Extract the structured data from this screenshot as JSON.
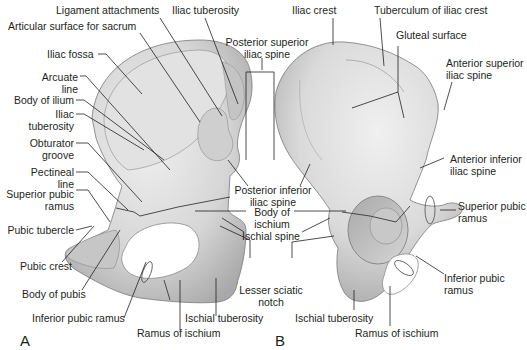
{
  "figure": {
    "panels": [
      {
        "id": "A",
        "label": "A",
        "view": "medial"
      },
      {
        "id": "B",
        "label": "B",
        "view": "lateral"
      }
    ],
    "colors": {
      "background": "#ffffff",
      "bone_light": "#e6e6e6",
      "bone_mid": "#c9c9c9",
      "bone_dark": "#9d9d9d",
      "leader_line": "#231f20",
      "text": "#231f20"
    },
    "labels_A": {
      "ligament_attachments": "Ligament attachments",
      "iliac_tuberosity_top": "Iliac tuberosity",
      "articular_surface": "Articular surface for sacrum",
      "iliac_fossa": "Iliac fossa",
      "arcuate_line_1": "Arcuate",
      "arcuate_line_2": "line",
      "body_of_ilium": "Body of ilium",
      "iliac_tuberosity_1": "Iliac",
      "iliac_tuberosity_2": "tuberosity",
      "obturator_groove_1": "Obturator",
      "obturator_groove_2": "groove",
      "pectineal_line_1": "Pectineal",
      "pectineal_line_2": "line",
      "superior_pubic_ramus_1": "Superior pubic",
      "superior_pubic_ramus_2": "ramus",
      "pubic_tubercle": "Pubic tubercle",
      "pubic_crest": "Pubic crest",
      "body_of_pubis": "Body of pubis",
      "inferior_pubic_ramus": "Inferior pubic ramus",
      "ramus_of_ischium": "Ramus of ischium",
      "ischial_tuberosity": "Ischial tuberosity"
    },
    "labels_shared": {
      "posterior_superior_1": "Posterior superior",
      "posterior_superior_2": "iliac spine",
      "posterior_inferior_1": "Posterior inferior",
      "posterior_inferior_2": "iliac spine",
      "body_of_ischium_1": "Body of",
      "body_of_ischium_2": "ischium",
      "ischial_spine": "Ischial spine",
      "lesser_sciatic_1": "Lesser sciatic",
      "lesser_sciatic_2": "notch"
    },
    "labels_B": {
      "iliac_crest": "Iliac crest",
      "tuberculum": "Tuberculum of iliac crest",
      "gluteal_surface": "Gluteal surface",
      "anterior_superior_1": "Anterior superior",
      "anterior_superior_2": "iliac spine",
      "anterior_inferior_1": "Anterior inferior",
      "anterior_inferior_2": "iliac spine",
      "superior_pubic_ramus_1": "Superior pubic",
      "superior_pubic_ramus_2": "ramus",
      "inferior_pubic_ramus_1": "Inferior pubic",
      "inferior_pubic_ramus_2": "ramus",
      "ischial_tuberosity": "Ischial tuberosity",
      "ramus_of_ischium": "Ramus of ischium"
    }
  }
}
